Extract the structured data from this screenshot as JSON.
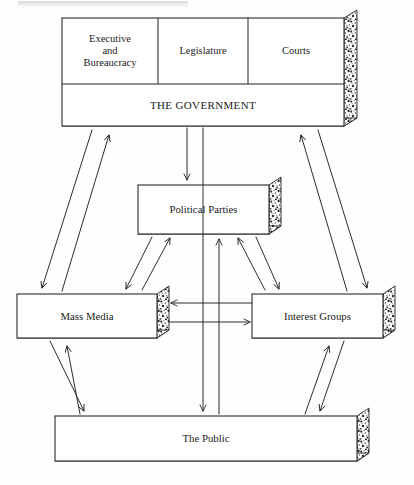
{
  "figure": {
    "title": "",
    "type": "block-flow-diagram"
  },
  "boxes": {
    "executive": {
      "label": "Executive\nand\nBureaucracy"
    },
    "legislature": {
      "label": "Legislature"
    },
    "courts": {
      "label": "Courts"
    },
    "government": {
      "label": "THE GOVERNMENT"
    },
    "political_parties": {
      "label": "Political Parties"
    },
    "mass_media": {
      "label": "Mass Media"
    },
    "interest_groups": {
      "label": "Interest Groups"
    },
    "public": {
      "label": "The Public"
    }
  },
  "connections": [
    {
      "name": "government-to-political-parties",
      "from": "government",
      "to": "political_parties",
      "direction": "down"
    },
    {
      "name": "government-to-public",
      "from": "government",
      "to": "public",
      "direction": "down"
    },
    {
      "name": "public-to-political-parties",
      "from": "public",
      "to": "political_parties",
      "direction": "up"
    },
    {
      "name": "government-mass-media",
      "from": "government",
      "to": "mass_media",
      "direction": "bidirectional"
    },
    {
      "name": "government-interest-groups",
      "from": "government",
      "to": "interest_groups",
      "direction": "bidirectional"
    },
    {
      "name": "political-parties-mass-media",
      "from": "political_parties",
      "to": "mass_media",
      "direction": "bidirectional"
    },
    {
      "name": "political-parties-interest-groups",
      "from": "political_parties",
      "to": "interest_groups",
      "direction": "bidirectional"
    },
    {
      "name": "interest-groups-to-mass-media",
      "from": "interest_groups",
      "to": "mass_media",
      "direction": "left"
    },
    {
      "name": "mass-media-to-interest-groups",
      "from": "mass_media",
      "to": "interest_groups",
      "direction": "right"
    },
    {
      "name": "public-mass-media",
      "from": "public",
      "to": "mass_media",
      "direction": "bidirectional"
    },
    {
      "name": "public-interest-groups",
      "from": "public",
      "to": "interest_groups",
      "direction": "bidirectional"
    }
  ],
  "colors": {
    "line": "#222222",
    "text": "#1b1b1b",
    "box_fill": "#ffffff",
    "shadow_fill": "#d8d8d8",
    "background": "#fefefe"
  }
}
